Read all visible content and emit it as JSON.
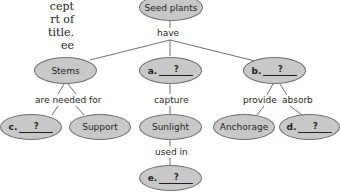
{
  "intro_text": "cept\nrt of\ntitle.\nee",
  "colors": {
    "node_fill": "#c8c8c9",
    "node_stroke": "#6d6e71",
    "line": "#6d6e71",
    "text": "#231f20"
  },
  "nodes": {
    "root": {
      "label": "Seed plants"
    },
    "stems": {
      "label": "Stems"
    },
    "a": {
      "letter": "a.",
      "blank": "?"
    },
    "b": {
      "letter": "b.",
      "blank": "?"
    },
    "c": {
      "letter": "c.",
      "blank": "?"
    },
    "support": {
      "label": "Support"
    },
    "sunlight": {
      "label": "Sunlight"
    },
    "anchorage": {
      "label": "Anchorage"
    },
    "d": {
      "letter": "d.",
      "blank": "?"
    },
    "e": {
      "letter": "e.",
      "blank": "?"
    }
  },
  "links": {
    "have": "have",
    "are_needed_for": "are needed for",
    "capture": "capture",
    "provide": "provide",
    "absorb": "absorb",
    "used_in": "used in"
  }
}
